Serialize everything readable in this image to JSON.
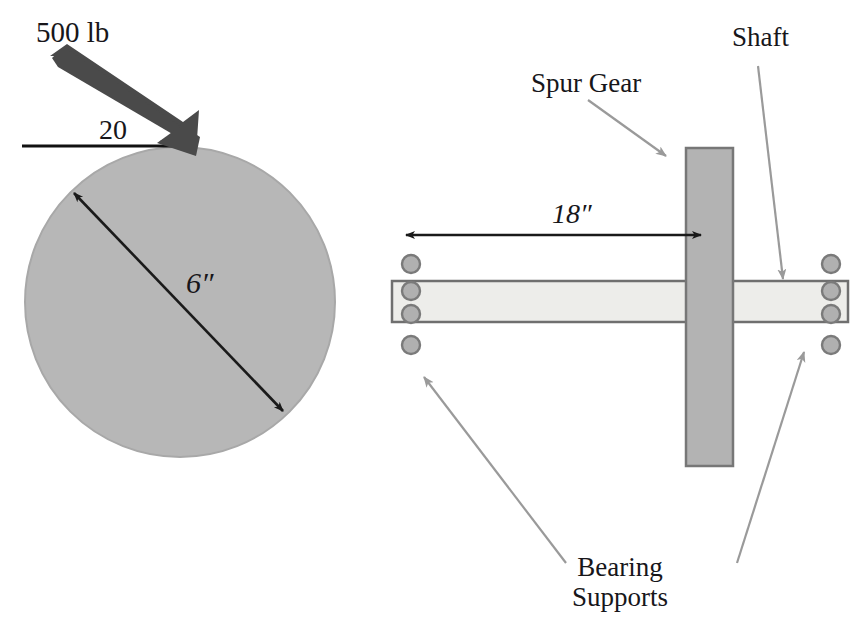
{
  "figure": {
    "width": 863,
    "height": 640
  },
  "colors": {
    "background": "#ffffff",
    "text": "#17161a",
    "gear_fill": "#b3b3b3",
    "gear_stroke": "#777777",
    "shaft_fill": "#ededea",
    "shaft_stroke": "#6f6f6f",
    "disk_fill": "#b7b7b7",
    "disk_stroke": "#a8a8a8",
    "force_arrow": "#4a4a4a",
    "dimension_line": "#1a1a1a",
    "leader_line": "#9a9a9a",
    "bearing_fill": "#b0b0b0",
    "bearing_stroke": "#7a7a7a"
  },
  "left_view": {
    "name": "gear-face-view",
    "force_label": "500 lb",
    "angle_label": "20",
    "diameter_label": "6″",
    "disk": {
      "cx": 180,
      "cy": 302,
      "r": 155
    },
    "force_arrow": {
      "x1": 58,
      "y1": 62,
      "x2": 188,
      "y2": 150,
      "thickness": 17
    },
    "angle_reference_line": {
      "x1": 22,
      "y1": 146,
      "x2": 190,
      "y2": 146
    },
    "diameter_arrow": {
      "x1": 74,
      "y1": 193,
      "x2": 283,
      "y2": 411
    }
  },
  "right_view": {
    "name": "shaft-side-view",
    "dimension_label": "18″",
    "gear_label": "Spur Gear",
    "shaft_label": "Shaft",
    "bearing_label_line1": "Bearing",
    "bearing_label_line2": "Supports",
    "gear_rect": {
      "x": 686,
      "y": 148,
      "w": 47,
      "h": 318
    },
    "shaft_rect": {
      "x": 392,
      "y": 281,
      "w": 456,
      "h": 41
    },
    "dimension_line": {
      "x1": 406,
      "y1": 235,
      "x2": 701,
      "y2": 235
    },
    "bearings_left_x": 411,
    "bearings_right_x": 831,
    "bearing_rows_y": [
      264,
      291,
      314,
      345
    ],
    "bearing_radius": 9
  },
  "annotations": [
    {
      "name": "spur-gear-leader",
      "label": "Spur Gear",
      "x1": 588,
      "y1": 100,
      "x2": 666,
      "y2": 156
    },
    {
      "name": "shaft-leader",
      "label": "Shaft",
      "x1": 758,
      "y1": 66,
      "x2": 783,
      "y2": 279
    },
    {
      "name": "bearing-left-leader",
      "label": "Bearing Supports",
      "x1": 566,
      "y1": 563,
      "x2": 424,
      "y2": 377
    },
    {
      "name": "bearing-right-leader",
      "label": "Bearing Supports",
      "x1": 737,
      "y1": 563,
      "x2": 804,
      "y2": 352
    }
  ]
}
